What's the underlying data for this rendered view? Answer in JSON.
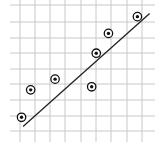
{
  "chart_data": {
    "type": "scatter",
    "title": "",
    "xlabel": "",
    "ylabel": "",
    "grid": true,
    "legend": null,
    "xlim": [
      -0.5,
      8.9
    ],
    "ylim": [
      -0.5,
      8.2
    ],
    "x": [
      0.1,
      0.7,
      2.3,
      4.7,
      5.0,
      5.8,
      7.7
    ],
    "y": [
      0.9,
      2.7,
      3.4,
      2.9,
      5.1,
      6.4,
      7.5
    ],
    "trend_line": {
      "x": [
        0.2,
        8.5
      ],
      "y": [
        0.3,
        7.7
      ]
    },
    "marker": "circled-dot"
  },
  "layout": {
    "grid_color": "#c8c8c8",
    "line_color": "#222222",
    "marker_color": "#111111",
    "grid_x_px": [
      20,
      35,
      50,
      65,
      81,
      96,
      111,
      127,
      142
    ],
    "grid_y_px": [
      5,
      22,
      38,
      53,
      69,
      84,
      100,
      116,
      131
    ],
    "grid_x_extent": [
      10,
      155
    ],
    "grid_y_extent": [
      0,
      142
    ]
  }
}
